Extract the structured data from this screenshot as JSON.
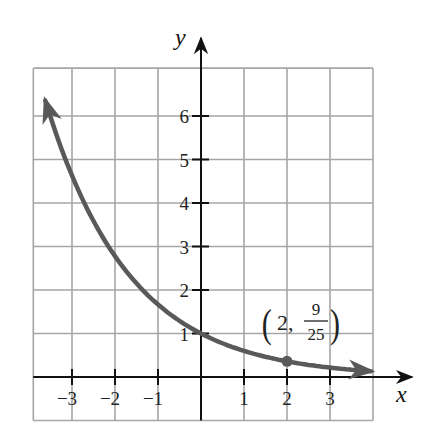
{
  "chart_data": {
    "type": "line",
    "title": "",
    "function": "y = (3/5)^x",
    "xlabel": "x",
    "ylabel": "y",
    "xlim": [
      -4,
      4
    ],
    "ylim": [
      -1,
      7
    ],
    "grid": true,
    "x_ticks": [
      -3,
      -2,
      -1,
      1,
      2,
      3
    ],
    "x_tick_labels": [
      "−3",
      "−2",
      "−1",
      "1",
      "2",
      "3"
    ],
    "y_ticks": [
      1,
      2,
      3,
      4,
      5,
      6
    ],
    "y_tick_labels": [
      "1",
      "2",
      "3",
      "4",
      "5",
      "6"
    ],
    "series": [
      {
        "name": "curve",
        "x": [
          -3.6,
          -3,
          -2,
          -1,
          0,
          1,
          2,
          3,
          4
        ],
        "y": [
          6.29,
          4.63,
          2.78,
          1.67,
          1,
          0.6,
          0.36,
          0.22,
          0.13
        ],
        "color": "#595959",
        "arrows": "both"
      }
    ],
    "annotations": [
      {
        "point": [
          2,
          0.36
        ],
        "label_open": "(",
        "label_x": "2,",
        "label_num": "9",
        "label_den": "25",
        "label_close": ")",
        "marker": "dot"
      }
    ]
  },
  "colors": {
    "grid": "#a6a6a6",
    "axes": "#111111",
    "curve": "#595959"
  }
}
